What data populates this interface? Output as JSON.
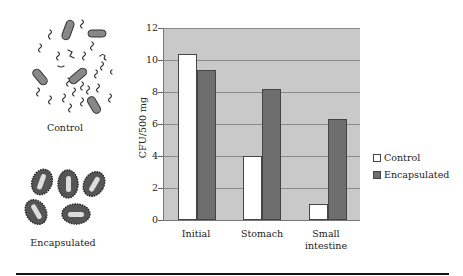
{
  "illustrations": {
    "control": {
      "label": "Control",
      "icon": "free-bacteria-icon"
    },
    "encapsulated": {
      "label": "Encapsulated",
      "icon": "encapsulated-bacteria-icon"
    }
  },
  "chart_data": {
    "type": "bar",
    "title": "",
    "xlabel": "",
    "ylabel": "CFU/500 mg",
    "ylim": [
      0,
      12
    ],
    "yticks": [
      0,
      2,
      4,
      6,
      8,
      10,
      12
    ],
    "grid": true,
    "legend_position": "right",
    "categories": [
      "Initial",
      "Stomach",
      "Small intestine"
    ],
    "series": [
      {
        "name": "Control",
        "color": "#ffffff",
        "values": [
          10.4,
          4.0,
          1.0
        ]
      },
      {
        "name": "Encapsulated",
        "color": "#6e6e6e",
        "values": [
          9.4,
          8.2,
          6.3
        ]
      }
    ]
  },
  "chart_labels": {
    "ylabel": "CFU/500 mg",
    "yticks": [
      "0",
      "2",
      "4",
      "6",
      "8",
      "10",
      "12"
    ],
    "x": [
      "Initial",
      "Stomach",
      "Small",
      "intestine"
    ],
    "legend": [
      "Control",
      "Encapsulated"
    ]
  }
}
